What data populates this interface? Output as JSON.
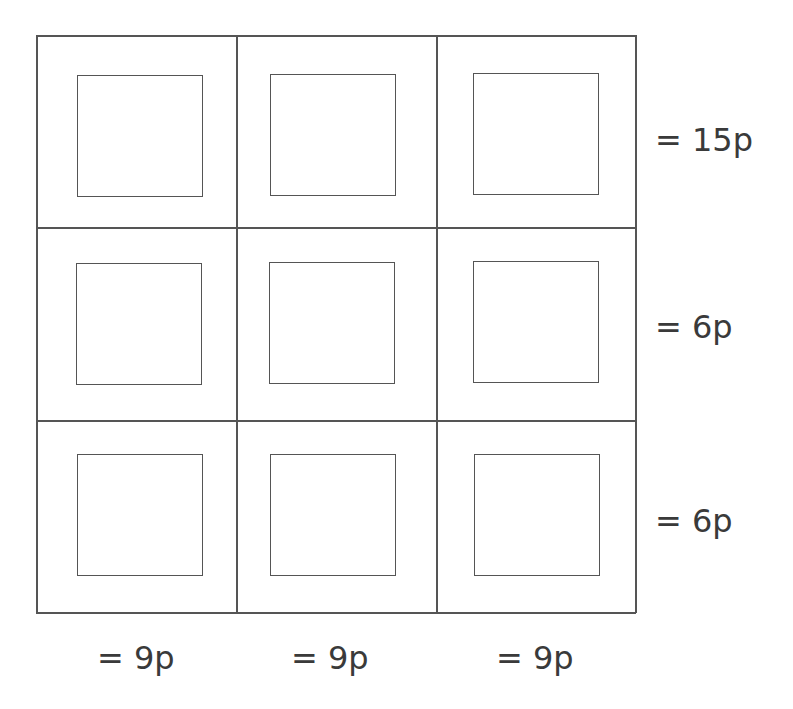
{
  "diagram": {
    "type": "grid-puzzle",
    "rows": 3,
    "cols": 3,
    "cells": [
      [
        {
          "row": 1,
          "col": 1,
          "value": ""
        },
        {
          "row": 1,
          "col": 2,
          "value": ""
        },
        {
          "row": 1,
          "col": 3,
          "value": ""
        }
      ],
      [
        {
          "row": 2,
          "col": 1,
          "value": ""
        },
        {
          "row": 2,
          "col": 2,
          "value": ""
        },
        {
          "row": 2,
          "col": 3,
          "value": ""
        }
      ],
      [
        {
          "row": 3,
          "col": 1,
          "value": ""
        },
        {
          "row": 3,
          "col": 2,
          "value": ""
        },
        {
          "row": 3,
          "col": 3,
          "value": ""
        }
      ]
    ],
    "row_totals": [
      "= 15p",
      "= 6p",
      "= 6p"
    ],
    "col_totals": [
      "= 9p",
      "= 9p",
      "= 9p"
    ],
    "line_color": "#555555",
    "text_color": "#3a3a3a"
  }
}
